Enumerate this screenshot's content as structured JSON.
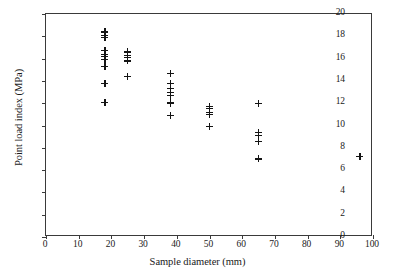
{
  "chart_data": {
    "type": "scatter",
    "title": "",
    "xlabel": "Sample diameter (mm)",
    "ylabel": "Point load index (MPa)",
    "xlim": [
      0,
      100
    ],
    "ylim": [
      0,
      20
    ],
    "xticks": [
      0,
      10,
      20,
      30,
      40,
      50,
      60,
      70,
      80,
      90,
      100
    ],
    "yticks": [
      0,
      2,
      4,
      6,
      8,
      10,
      12,
      14,
      16,
      18,
      20
    ],
    "grid": false,
    "legend": null,
    "marker": "plus",
    "marker_color": "#141414",
    "points": [
      {
        "x": 18,
        "y": 18.4
      },
      {
        "x": 18,
        "y": 18.1
      },
      {
        "x": 18,
        "y": 17.9
      },
      {
        "x": 18,
        "y": 16.7
      },
      {
        "x": 18,
        "y": 16.4
      },
      {
        "x": 18,
        "y": 16.2
      },
      {
        "x": 18,
        "y": 15.9
      },
      {
        "x": 18,
        "y": 15.3
      },
      {
        "x": 18,
        "y": 13.8
      },
      {
        "x": 18,
        "y": 12.1
      },
      {
        "x": 25,
        "y": 16.6
      },
      {
        "x": 25,
        "y": 16.3
      },
      {
        "x": 25,
        "y": 16.1
      },
      {
        "x": 25,
        "y": 15.8
      },
      {
        "x": 25,
        "y": 14.4
      },
      {
        "x": 38,
        "y": 14.7
      },
      {
        "x": 38,
        "y": 13.8
      },
      {
        "x": 38,
        "y": 13.3
      },
      {
        "x": 38,
        "y": 13.0
      },
      {
        "x": 38,
        "y": 12.7
      },
      {
        "x": 38,
        "y": 12.1
      },
      {
        "x": 38,
        "y": 12.0
      },
      {
        "x": 38,
        "y": 10.9
      },
      {
        "x": 50,
        "y": 11.7
      },
      {
        "x": 50,
        "y": 11.5
      },
      {
        "x": 50,
        "y": 11.2
      },
      {
        "x": 50,
        "y": 11.0
      },
      {
        "x": 50,
        "y": 9.9
      },
      {
        "x": 65,
        "y": 12.0
      },
      {
        "x": 65,
        "y": 9.4
      },
      {
        "x": 65,
        "y": 9.1
      },
      {
        "x": 65,
        "y": 8.6
      },
      {
        "x": 65,
        "y": 7.0
      },
      {
        "x": 96,
        "y": 7.2
      }
    ]
  }
}
